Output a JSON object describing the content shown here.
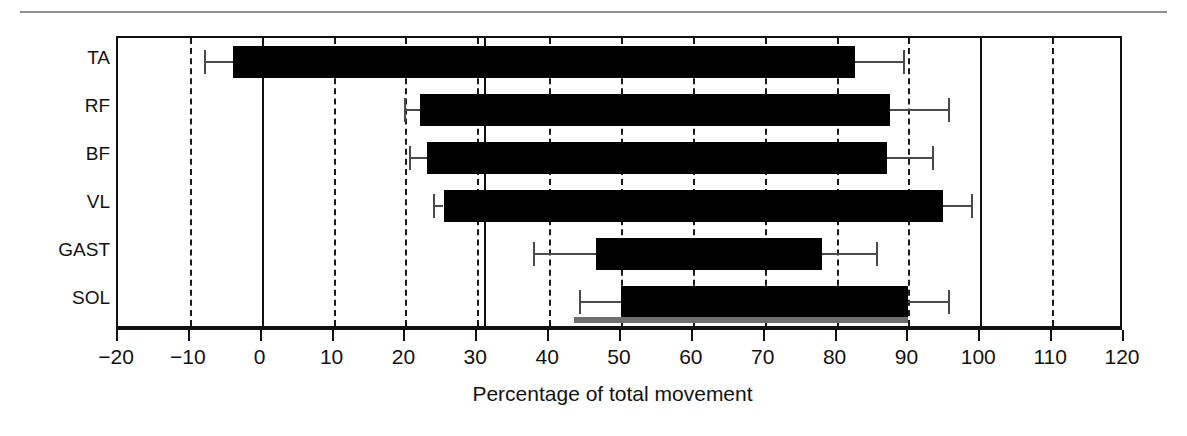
{
  "figure": {
    "top_rule": true,
    "colors": {
      "bar": "#000000",
      "error": "#4a4a4a",
      "grid": "#1a1a1a",
      "frame": "#111111",
      "grey_reference_bar": "#6e6e6e",
      "background": "#ffffff"
    }
  },
  "chart_data": {
    "type": "bar",
    "orientation": "horizontal",
    "title": "",
    "xlabel": "Percentage of total movement",
    "ylabel": "",
    "xlim": [
      -20,
      120
    ],
    "ylim": [
      0,
      6
    ],
    "xticks": [
      -20,
      -10,
      0,
      10,
      20,
      30,
      40,
      50,
      60,
      70,
      80,
      90,
      100,
      110,
      120
    ],
    "xticklabels": [
      "−20",
      "−10",
      "0",
      "10",
      "20",
      "30",
      "40",
      "50",
      "60",
      "70",
      "80",
      "90",
      "100",
      "110",
      "120"
    ],
    "grid": "vertical dashed at every 10 units",
    "categories": [
      "TA",
      "RF",
      "BF",
      "VL",
      "GAST",
      "SOL"
    ],
    "bars": [
      {
        "label": "TA",
        "start": -4,
        "end": 82.5,
        "onset": -4,
        "onset_error_low": -8.0,
        "offset": 82.5,
        "offset_error_high": 89.5
      },
      {
        "label": "RF",
        "start": 22,
        "end": 87.5,
        "onset": 22,
        "onset_error_low": 19.8,
        "offset": 87.5,
        "offset_error_high": 95.8
      },
      {
        "label": "BF",
        "start": 23,
        "end": 87.0,
        "onset": 23,
        "onset_error_low": 20.5,
        "offset": 87.0,
        "offset_error_high": 93.5
      },
      {
        "label": "VL",
        "start": 25.3,
        "end": 94.8,
        "onset": 25.3,
        "onset_error_low": 23.8,
        "offset": 94.8,
        "offset_error_high": 99.0
      },
      {
        "label": "GAST",
        "start": 46.5,
        "end": 78.0,
        "onset": 46.5,
        "onset_error_low": 37.7,
        "offset": 78.0,
        "offset_error_high": 85.8
      },
      {
        "label": "SOL",
        "start": 50.0,
        "end": 89.9,
        "onset": 50.0,
        "onset_error_low": 44.2,
        "offset": 89.9,
        "offset_error_high": 95.8
      }
    ],
    "vertical_reference_lines": [
      {
        "value": 0,
        "style": "solid"
      },
      {
        "value": 31,
        "style": "solid"
      },
      {
        "value": 100,
        "style": "solid"
      }
    ],
    "grey_reference_bar": {
      "start": 43.5,
      "end": 90.0,
      "position": "baseline"
    },
    "legend": null,
    "annotations": []
  }
}
